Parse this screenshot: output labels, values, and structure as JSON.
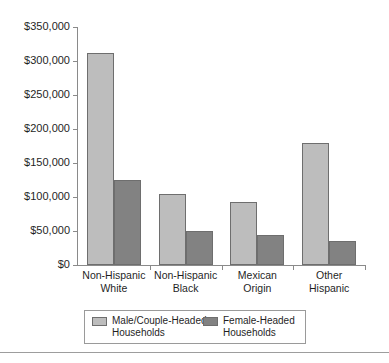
{
  "chart_data": {
    "type": "bar",
    "title": "",
    "subtitle": "",
    "xlabel": "",
    "ylabel": "",
    "categories": [
      "Non-Hispanic\nWhite",
      "Non-Hispanic\nBlack",
      "Mexican\nOrigin",
      "Other\nHispanic"
    ],
    "series": [
      {
        "name": "Male/Couple-Headed\nHouseholds",
        "color": "#bdbdbd",
        "values": [
          312000,
          104000,
          92000,
          180000
        ]
      },
      {
        "name": "Female-Headed\nHouseholds",
        "color": "#828282",
        "values": [
          125000,
          50000,
          44000,
          35000
        ]
      }
    ],
    "ylim": [
      0,
      350000
    ],
    "yticks": [
      0,
      50000,
      100000,
      150000,
      200000,
      250000,
      300000,
      350000
    ],
    "ytick_labels": [
      "$0",
      "$50,000",
      "$100,000",
      "$150,000",
      "$200,000",
      "$250,000",
      "$300,000",
      "$350,000"
    ],
    "grid": false,
    "legend_position": "bottom"
  },
  "legend": {
    "entries": [
      {
        "label": "Male/Couple-Headed\nHouseholds",
        "color": "#bdbdbd"
      },
      {
        "label": "Female-Headed\nHouseholds",
        "color": "#828282"
      }
    ]
  },
  "colors": {
    "male_bar": "#bdbdbd",
    "female_bar": "#828282",
    "bar_outline": "#6e6e6e",
    "axis": "#8a8a8a",
    "text": "#1f1f1f",
    "background": "#ffffff",
    "rule": "#9d9d9d"
  }
}
